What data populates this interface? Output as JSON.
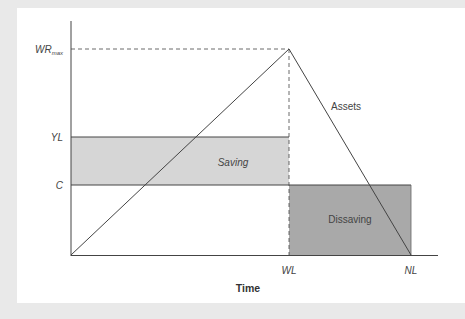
{
  "diagram": {
    "x_axis": {
      "label": "Time",
      "ticks": [
        {
          "label": "WL",
          "x": 289
        },
        {
          "label": "NL",
          "x": 411
        }
      ]
    },
    "y_axis": {
      "ticks": [
        {
          "label": "WR",
          "sub": "max",
          "y": 49
        },
        {
          "label": "YL",
          "y": 137
        },
        {
          "label": "C",
          "y": 185
        }
      ]
    },
    "regions": [
      {
        "name": "saving",
        "label": "Saving",
        "fill": "#d6d6d6"
      },
      {
        "name": "dissaving",
        "label": "Dissaving",
        "fill": "#a9a9a9"
      }
    ],
    "curves": [
      {
        "name": "assets",
        "label": "Assets",
        "points": [
          [
            71,
            255
          ],
          [
            289,
            49
          ],
          [
            411,
            255
          ]
        ]
      }
    ],
    "colors": {
      "background": "#e9e9e9",
      "panel": "#ffffff",
      "line": "#444444",
      "saving_fill": "#d6d6d6",
      "dissaving_fill": "#a9a9a9"
    }
  }
}
